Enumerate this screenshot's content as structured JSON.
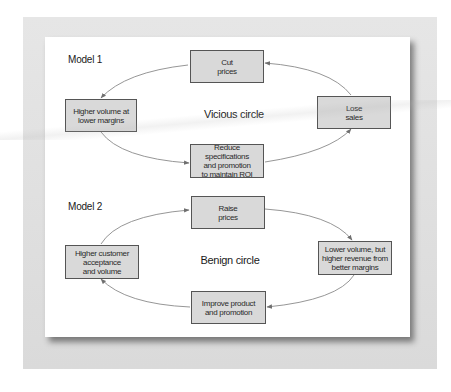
{
  "model1": {
    "title": "Model 1",
    "center_label": "Vicious circle",
    "boxes": {
      "top": "Cut\nprices",
      "left": "Higher volume at\nlower margins",
      "right": "Lose\nsales",
      "bottom": "Reduce specifications\nand promotion\nto maintain ROI"
    },
    "flow": [
      "Cut prices",
      "Higher volume at lower margins",
      "Reduce specifications and promotion to maintain ROI",
      "Lose sales",
      "Cut prices"
    ]
  },
  "model2": {
    "title": "Model 2",
    "center_label": "Benign circle",
    "boxes": {
      "top": "Raise\nprices",
      "left": "Higher customer\nacceptance\nand volume",
      "right": "Lower volume, but\nhigher revenue from\nbetter margins",
      "bottom": "Improve product\nand promotion"
    },
    "flow": [
      "Raise prices",
      "Lower volume, but higher revenue from better margins",
      "Improve product and promotion",
      "Higher customer acceptance and volume",
      "Raise prices"
    ]
  },
  "colors": {
    "box_fill": "#d9d9d9",
    "box_border": "#555555",
    "arrow": "#7a7a7a",
    "frame": "#dedede"
  }
}
